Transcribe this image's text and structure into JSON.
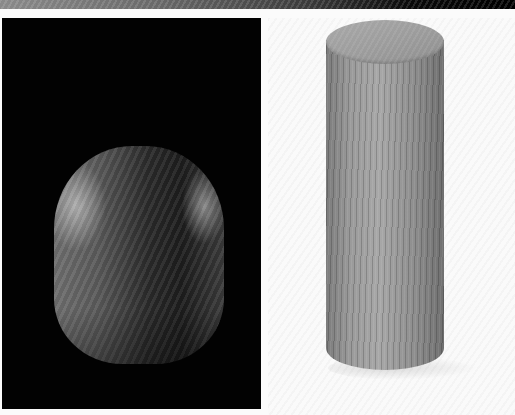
{
  "image": {
    "description": "Two wooden objects photographed side by side",
    "panels": [
      {
        "id": "left",
        "background": "#020202",
        "subject": "rounded dome-shaped wooden block with visible grain",
        "label": "Rounded wooden block"
      },
      {
        "id": "right",
        "background": "#fafafa",
        "subject": "upright wooden cylinder with vertical grain",
        "label": "Wooden cylinder"
      }
    ],
    "top_strip": {
      "subject": "cropped edge of an adjacent photo (grey to black gradient)"
    }
  }
}
